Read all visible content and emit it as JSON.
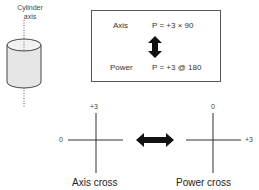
{
  "cylinder": {
    "label_line1": "Cylinder",
    "label_line2": "axis"
  },
  "notation_box": {
    "rows": [
      {
        "label": "Axis",
        "formula": "P = +3 × 90"
      },
      {
        "label": "Power",
        "formula": "P = +3 @ 180"
      }
    ],
    "connector": "double-vertical-arrow"
  },
  "axis_cross": {
    "top_label": "+3",
    "left_label": "0",
    "caption": "Axis cross"
  },
  "power_cross": {
    "top_label": "0",
    "right_label": "+3",
    "caption": "Power cross"
  },
  "center_connector": "double-horizontal-arrow",
  "colors": {
    "line": "#333333",
    "cylinder_fill": "#e6e6e6",
    "cylinder_stroke": "#444444"
  }
}
